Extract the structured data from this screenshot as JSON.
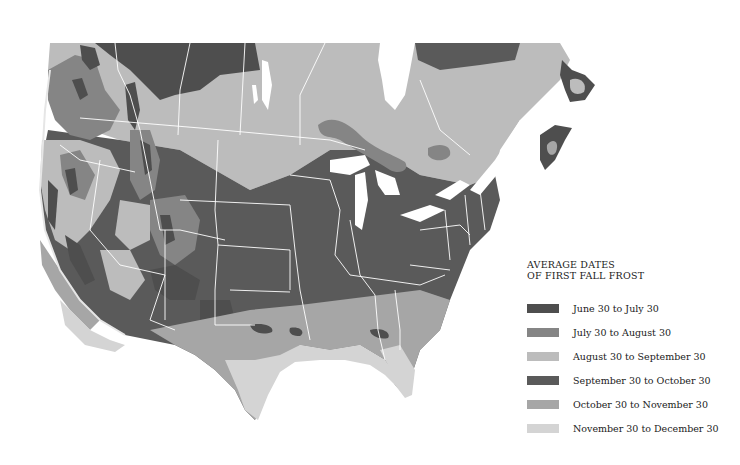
{
  "map": {
    "title": "Average Dates of First Fall Frost",
    "region": "North America (United States and southern Canada)",
    "background": "#ffffff",
    "border_color": "#ffffff",
    "water_color": "#ffffff"
  },
  "legend": {
    "title_line1": "AVERAGE DATES",
    "title_line2": "OF FIRST FALL FROST",
    "items": [
      {
        "label": "June 30 to July 30",
        "color": "#4e4e4e"
      },
      {
        "label": "July 30 to August 30",
        "color": "#858585"
      },
      {
        "label": "August 30 to September 30",
        "color": "#bcbcbc"
      },
      {
        "label": "September 30 to October 30",
        "color": "#5a5a5a"
      },
      {
        "label": "October 30 to November 30",
        "color": "#a6a6a6"
      },
      {
        "label": "November 30 to December 30",
        "color": "#d4d4d4"
      }
    ]
  }
}
